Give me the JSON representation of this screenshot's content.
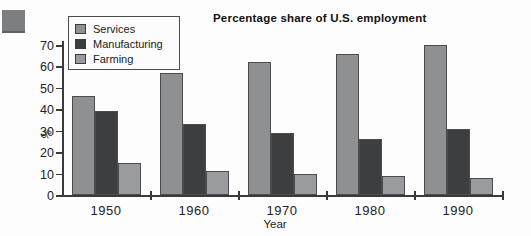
{
  "figure": {
    "decor_square_color": "#7c7e80",
    "background": "#fdfdfd"
  },
  "chart_data": {
    "type": "bar",
    "title": "Percentage share of U.S. employment",
    "xlabel": "Year",
    "ylabel": "%",
    "categories": [
      "1950",
      "1960",
      "1970",
      "1980",
      "1990"
    ],
    "series": [
      {
        "name": "Services",
        "color": "#8e9092",
        "values": [
          46,
          57,
          62,
          66,
          70
        ]
      },
      {
        "name": "Manufacturing",
        "color": "#3c3e40",
        "values": [
          39,
          33,
          29,
          26,
          31
        ]
      },
      {
        "name": "Farming",
        "color": "#999b9e",
        "values": [
          15,
          11,
          10,
          9,
          8
        ]
      }
    ],
    "ylim": [
      0,
      70
    ],
    "ytick_step": 10,
    "yticks": [
      "0",
      "10",
      "20",
      "30",
      "40",
      "50",
      "60",
      "70"
    ],
    "grid": false,
    "legend_position": "top-left",
    "axis_color": "#3a3a3a"
  }
}
